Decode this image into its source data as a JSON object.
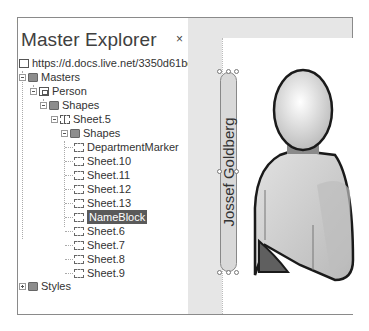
{
  "panel": {
    "title": "Master Explorer",
    "close_glyph": "×"
  },
  "tree": {
    "root": {
      "label": "https://d.docs.live.net/3350d61bc93733a",
      "icon": "document-icon"
    },
    "masters": {
      "label": "Masters",
      "icon": "folder-icon",
      "expanded": true
    },
    "person": {
      "label": "Person",
      "icon": "master-icon",
      "expanded": true
    },
    "shapes1": {
      "label": "Shapes",
      "icon": "folder-icon",
      "expanded": true
    },
    "sheet5": {
      "label": "Sheet.5",
      "icon": "group-icon",
      "expanded": true
    },
    "shapes2": {
      "label": "Shapes",
      "icon": "folder-icon",
      "expanded": true
    },
    "children": [
      {
        "label": "DepartmentMarker",
        "selected": false
      },
      {
        "label": "Sheet.10",
        "selected": false
      },
      {
        "label": "Sheet.11",
        "selected": false
      },
      {
        "label": "Sheet.12",
        "selected": false
      },
      {
        "label": "Sheet.13",
        "selected": false
      },
      {
        "label": "NameBlock",
        "selected": true
      },
      {
        "label": "Sheet.6",
        "selected": false
      },
      {
        "label": "Sheet.7",
        "selected": false
      },
      {
        "label": "Sheet.8",
        "selected": false
      },
      {
        "label": "Sheet.9",
        "selected": false
      }
    ],
    "styles": {
      "label": "Styles",
      "icon": "folder-icon",
      "expanded": false
    }
  },
  "canvas": {
    "name_block_text": "Jossef Goldberg",
    "shape": "person-icon"
  },
  "colors": {
    "selection": "#5a5a5a",
    "frame_border": "#8a8a8a",
    "canvas_background": "#e6e6e6",
    "department_marker": "#5f5f5f"
  }
}
